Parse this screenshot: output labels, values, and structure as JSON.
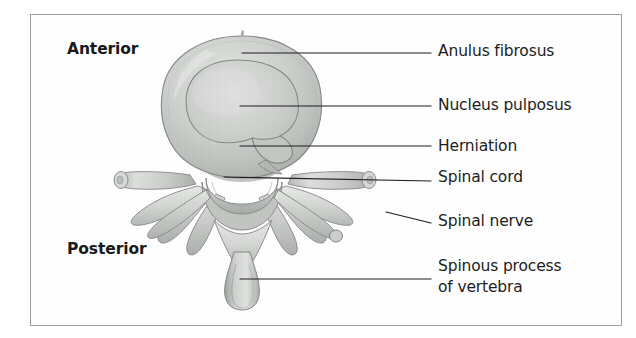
{
  "figure": {
    "type": "anatomical-illustration",
    "border_color": "#8d8f8d",
    "background_color": "#ffffff",
    "ink_color": "#1d1d1d"
  },
  "orientation": {
    "anterior_label": "Anterior",
    "posterior_label": "Posterior"
  },
  "callouts": [
    {
      "key": "anulus",
      "label": "Anulus fibrosus"
    },
    {
      "key": "nucleus",
      "label": "Nucleus pulposus"
    },
    {
      "key": "herniation",
      "label": "Herniation"
    },
    {
      "key": "cord",
      "label": "Spinal cord"
    },
    {
      "key": "nerve",
      "label": "Spinal nerve"
    },
    {
      "key": "spinous",
      "label": "Spinous process",
      "label_line2": "of vertebra"
    }
  ],
  "labels": {
    "anulus": "Anulus fibrosus",
    "nucleus": "Nucleus pulposus",
    "herniation": "Herniation",
    "spinal_cord": "Spinal cord",
    "spinal_nerve": "Spinal nerve",
    "spinous_process": "Spinous process",
    "spinous_process_line2": "of vertebra"
  },
  "structures": {
    "disc_fill_light": "#d2d5d2",
    "disc_fill_mid": "#bcbfbc",
    "disc_fill_dark": "#9aa09a",
    "bone_fill_light": "#dcdedc",
    "bone_fill_mid": "#c2c5c2",
    "bone_outline": "#6e726e"
  }
}
